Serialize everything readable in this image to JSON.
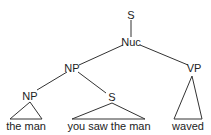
{
  "tree": {
    "root": "S",
    "nuc": "Nuc",
    "np": "NP",
    "vp": "VP",
    "np_inner": "NP",
    "s_inner": "S",
    "leaves": {
      "np_inner": "the man",
      "s_inner": "you saw the man",
      "vp": "waved"
    }
  }
}
